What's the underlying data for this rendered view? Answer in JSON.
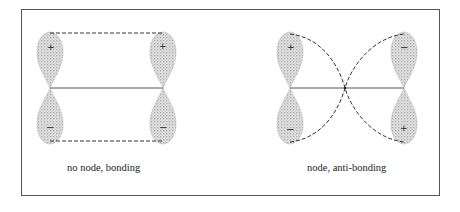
{
  "figure": {
    "panels": [
      {
        "id": "bonding",
        "caption": "no node, bonding",
        "lobes": [
          {
            "position": "upper-left",
            "sign": "+"
          },
          {
            "position": "lower-left",
            "sign": "−"
          },
          {
            "position": "upper-right",
            "sign": "+"
          },
          {
            "position": "lower-right",
            "sign": "−"
          }
        ],
        "connector": "dashed rectangle (no node)"
      },
      {
        "id": "anti-bonding",
        "caption": "node, anti-bonding",
        "lobes": [
          {
            "position": "upper-left",
            "sign": "+"
          },
          {
            "position": "lower-left",
            "sign": "−"
          },
          {
            "position": "upper-right",
            "sign": "−"
          },
          {
            "position": "lower-right",
            "sign": "+"
          }
        ],
        "connector": "crossing dashed curves (node at center)"
      }
    ],
    "colors": {
      "lobe_fill": "#cfcfcf",
      "stipple": "#666666",
      "line": "#333333",
      "border": "#555555"
    }
  }
}
